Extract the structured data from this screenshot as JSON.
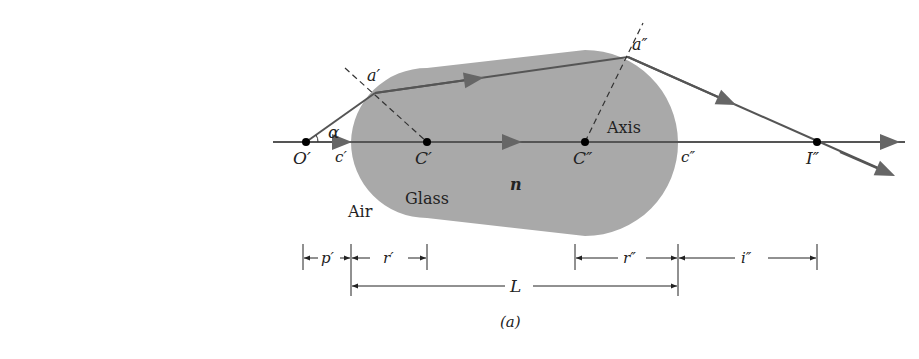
{
  "figure": {
    "caption": "(a)",
    "colors": {
      "glass": "#a9a9a9",
      "ray": "#555555",
      "text": "#222222",
      "background": "#ffffff"
    }
  },
  "labels": {
    "object_point": "O′",
    "center_first": "C′",
    "center_second": "C″",
    "image_point": "I″",
    "vertex_first": "c′",
    "vertex_second": "c″",
    "incidence_first": "a′",
    "incidence_second": "a″",
    "angle": "α",
    "axis": "Axis",
    "medium_outside": "Air",
    "medium_inside": "Glass",
    "index": "n"
  },
  "dimensions": {
    "object_distance": "p′",
    "radius_first": "r′",
    "radius_second": "r″",
    "image_distance": "i″",
    "length": "L"
  }
}
